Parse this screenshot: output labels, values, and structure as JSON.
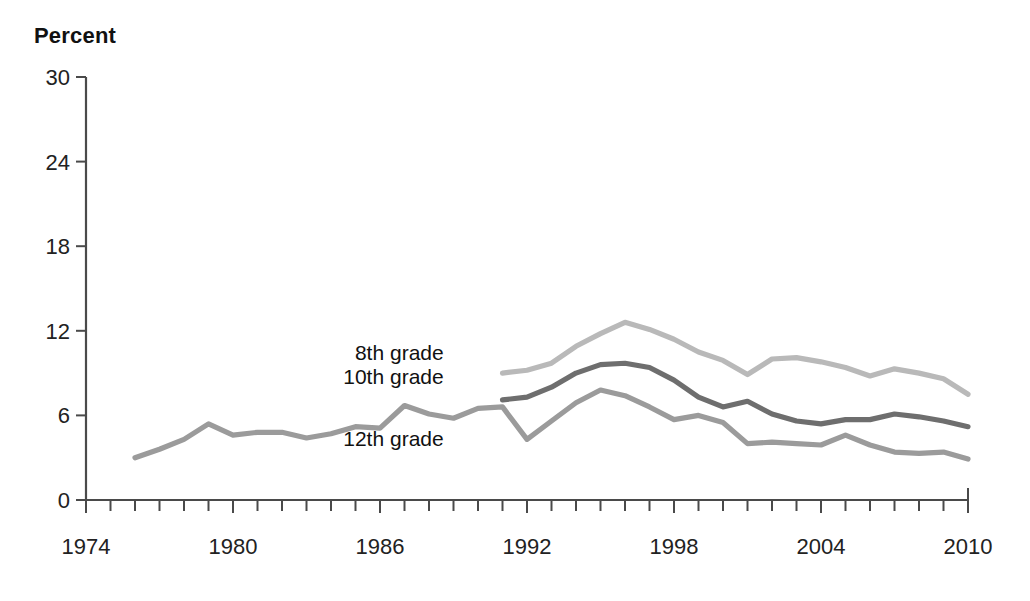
{
  "axis_title": "Percent",
  "chart_data": {
    "type": "line",
    "title": "Percent",
    "xlabel": "",
    "ylabel": "Percent",
    "xlim": [
      1974,
      2010
    ],
    "ylim": [
      0,
      30
    ],
    "ytick_values": [
      0,
      6,
      12,
      18,
      24,
      30
    ],
    "ytick_labels": [
      "0",
      "6",
      "12",
      "18",
      "24",
      "30"
    ],
    "xtick_labels": [
      "1974",
      "1980",
      "1986",
      "1992",
      "1998",
      "2004",
      "2010"
    ],
    "xtick_label_values": [
      1974,
      1980,
      1986,
      1992,
      1998,
      2004,
      2010
    ],
    "xtick_minor_step": 1,
    "grid": false,
    "legend_position": "inline-labels",
    "series": [
      {
        "name": "8th grade",
        "color": "#b9b9b9",
        "label_x": 1988.6,
        "label_y": 9.9,
        "x": [
          1991,
          1992,
          1993,
          1994,
          1995,
          1996,
          1997,
          1998,
          1999,
          2000,
          2001,
          2002,
          2003,
          2004,
          2005,
          2006,
          2007,
          2008,
          2009,
          2010
        ],
        "values": [
          9.0,
          9.2,
          9.7,
          10.9,
          11.8,
          12.6,
          12.1,
          11.4,
          10.5,
          9.9,
          8.9,
          10.0,
          10.1,
          9.8,
          9.4,
          8.8,
          9.3,
          9.0,
          8.6,
          7.5
        ]
      },
      {
        "name": "10th grade",
        "color": "#6e6e6e",
        "label_x": 1988.6,
        "label_y": 8.2,
        "x": [
          1991,
          1992,
          1993,
          1994,
          1995,
          1996,
          1997,
          1998,
          1999,
          2000,
          2001,
          2002,
          2003,
          2004,
          2005,
          2006,
          2007,
          2008,
          2009,
          2010
        ],
        "values": [
          7.1,
          7.3,
          8.0,
          9.0,
          9.6,
          9.7,
          9.4,
          8.5,
          7.3,
          6.6,
          7.0,
          6.1,
          5.6,
          5.4,
          5.7,
          5.7,
          6.1,
          5.9,
          5.6,
          5.2
        ]
      },
      {
        "name": "12th grade",
        "color": "#9b9b9b",
        "label_x": 1988.6,
        "label_y": 3.8,
        "x": [
          1976,
          1977,
          1978,
          1979,
          1980,
          1981,
          1982,
          1983,
          1984,
          1985,
          1986,
          1987,
          1988,
          1989,
          1990,
          1991,
          1992,
          1993,
          1994,
          1995,
          1996,
          1997,
          1998,
          1999,
          2000,
          2001,
          2002,
          2003,
          2004,
          2005,
          2006,
          2007,
          2008,
          2009,
          2010
        ],
        "values": [
          3.0,
          3.6,
          4.3,
          5.4,
          4.6,
          4.8,
          4.8,
          4.4,
          4.7,
          5.2,
          5.1,
          6.7,
          6.1,
          5.8,
          6.5,
          6.6,
          4.3,
          5.6,
          6.9,
          7.8,
          7.4,
          6.6,
          5.7,
          6.0,
          5.5,
          4.0,
          4.1,
          4.0,
          3.9,
          4.6,
          3.9,
          3.4,
          3.3,
          3.4,
          2.9
        ]
      }
    ]
  }
}
